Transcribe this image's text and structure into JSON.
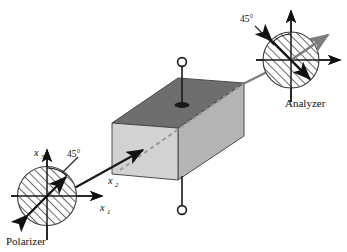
{
  "figure": {
    "type": "optics-schematic"
  },
  "polarizer": {
    "label": "Polarizer",
    "angle_label": "45°",
    "axes": {
      "x1": "x",
      "x1_sub": "1",
      "x2": "x",
      "x2_sub": "2",
      "x3": "x",
      "x3_sub": "3"
    },
    "hatch_direction": "45deg",
    "polarization_arrow": "double-headed-45deg"
  },
  "analyzer": {
    "label": "Analyzer",
    "angle_label": "45°",
    "hatch_direction": "45deg",
    "polarization_arrow": "double-headed-minus45deg"
  },
  "crystal": {
    "name": "electro-optic-crystal-block",
    "top_face_color": "#6e6e6e",
    "front_face_color": "#d2d2d2",
    "side_face_color": "#b4b4b4",
    "edge_color": "#4a4a4a"
  },
  "electrodes": {
    "top_terminal": "open-circle-terminal",
    "bottom_terminal": "open-circle-terminal",
    "lead_color": "#1a1a1a"
  },
  "beam": {
    "incident_color": "#1a1a1a",
    "internal_color": "#8a8a8a",
    "exit_color": "#7d7d7d",
    "internal_style": "dashed"
  },
  "colors": {
    "ink": "#111111",
    "hatch": "#3a3a3a",
    "axis": "#1a1a1a",
    "background": "#ffffff"
  }
}
